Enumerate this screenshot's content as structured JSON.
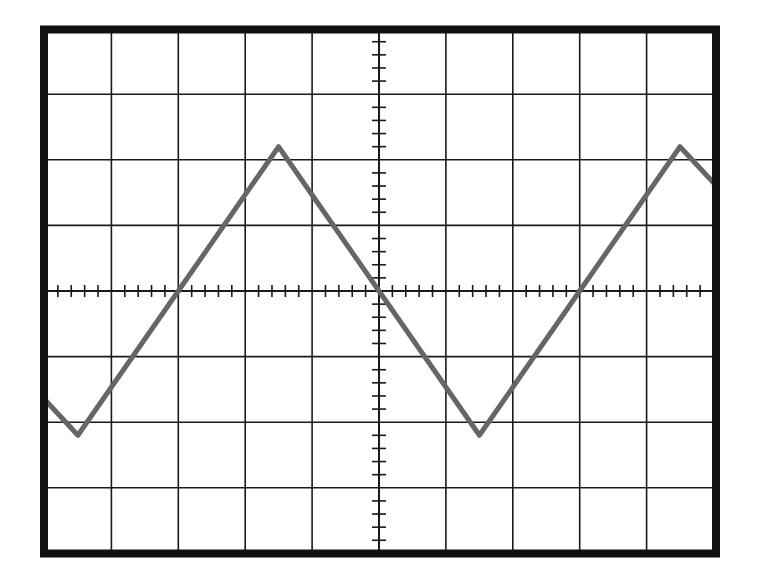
{
  "title": "",
  "screen": {
    "x_divisions": 10,
    "y_divisions": 8,
    "minor_ticks_per_division": 5,
    "grid_color": "#1a1a1a",
    "border_color": "#111111",
    "trace_color": "#666666",
    "background": "#ffffff"
  },
  "chart_data": {
    "type": "line",
    "title": "",
    "xlabel": "",
    "ylabel": "",
    "grid": true,
    "legend": null,
    "xlim": [
      -5,
      5
    ],
    "ylim": [
      -4,
      4
    ],
    "units": "divisions",
    "waveform": "triangle",
    "period_div": 6.0,
    "amplitude_div": 2.2,
    "phase_note": "falling zero crossing at screen center (x=0)",
    "series": [
      {
        "name": "trace",
        "x": [
          -5.0,
          -4.5,
          -3.0,
          -1.5,
          0.0,
          1.5,
          3.0,
          4.5,
          5.0
        ],
        "y": [
          -1.65,
          -2.2,
          0.0,
          2.2,
          0.0,
          -2.2,
          0.0,
          2.2,
          1.65
        ]
      }
    ],
    "peaks": [
      [
        -1.5,
        2.2
      ],
      [
        4.5,
        2.2
      ]
    ],
    "troughs": [
      [
        -4.5,
        -2.2
      ],
      [
        1.5,
        -2.2
      ]
    ],
    "zero_crossings": [
      -3.0,
      0.0,
      3.0
    ]
  }
}
